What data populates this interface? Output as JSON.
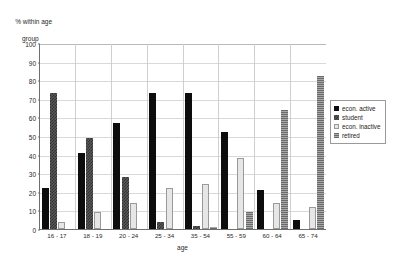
{
  "chart_data": {
    "type": "bar",
    "title": "",
    "ylabel": "% within age\ngroup",
    "ylabel_line1": "% within age",
    "ylabel_line2": "group",
    "xlabel": "age",
    "ylim": [
      0,
      100
    ],
    "yticks": [
      0,
      10,
      20,
      30,
      40,
      50,
      60,
      70,
      80,
      90,
      100
    ],
    "grid": true,
    "legend_position": "right",
    "categories": [
      "16 - 17",
      "18 - 19",
      "20 - 24",
      "25 - 34",
      "35 - 54",
      "55 - 59",
      "60 - 64",
      "65 - 74"
    ],
    "series": [
      {
        "name": "econ. active",
        "color": "#0d0d0d",
        "pattern": "solid",
        "values": [
          22,
          41,
          57,
          73,
          73,
          52,
          21,
          5
        ]
      },
      {
        "name": "student",
        "color": "#4a4a4a",
        "pattern": "checker",
        "values": [
          73,
          49,
          28,
          4,
          1.5,
          0,
          0,
          0
        ]
      },
      {
        "name": "econ. inactive",
        "color": "#e6e6e6",
        "pattern": "open",
        "values": [
          4,
          9,
          14,
          22,
          24,
          38,
          14,
          12
        ]
      },
      {
        "name": "retired",
        "color": "#8f8f8f",
        "pattern": "hatch",
        "values": [
          0,
          0,
          0,
          0,
          1,
          9,
          64,
          82
        ]
      }
    ]
  }
}
